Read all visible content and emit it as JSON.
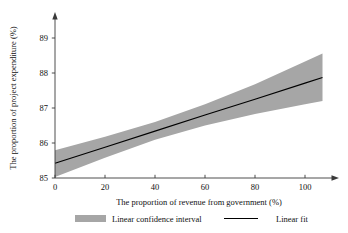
{
  "chart_data": {
    "type": "line",
    "title": "",
    "xlabel": "The proportion of revenue from government (%)",
    "ylabel": "The proportion of project expenditure (%)",
    "xlim": [
      0,
      109
    ],
    "ylim": [
      84.75,
      89.25
    ],
    "xticks": [
      0,
      20,
      40,
      60,
      80,
      100
    ],
    "xtick_labels": [
      "0",
      "20",
      "40",
      "60",
      "80",
      "100"
    ],
    "yticks": [
      85,
      86,
      87,
      88,
      89
    ],
    "ytick_labels": [
      "85",
      "86",
      "87",
      "88",
      "89"
    ],
    "grid": false,
    "legend_position": "below-axis",
    "series": [
      {
        "name": "Linear fit",
        "type": "line",
        "color": "#000000",
        "x": [
          0,
          20,
          40,
          60,
          80,
          100,
          107
        ],
        "values": [
          85.42,
          85.88,
          86.34,
          86.8,
          87.25,
          87.71,
          87.87
        ]
      },
      {
        "name": "Linear confidence interval",
        "type": "band",
        "color": "#a6a6a6",
        "x": [
          0,
          20,
          40,
          60,
          80,
          100,
          107
        ],
        "lower": [
          85.03,
          85.58,
          86.09,
          86.5,
          86.83,
          87.11,
          87.2
        ],
        "upper": [
          85.79,
          86.18,
          86.6,
          87.11,
          87.68,
          88.33,
          88.56
        ]
      }
    ],
    "annotations": []
  },
  "axes": {
    "x_title": "The proportion of revenue from government (%)",
    "y_title": "The proportion of project expenditure (%)"
  },
  "legend": {
    "items": [
      {
        "label": "Linear confidence interval",
        "marker": "swatch",
        "color": "#a6a6a6"
      },
      {
        "label": "Linear fit",
        "marker": "line",
        "color": "#000000"
      }
    ]
  }
}
